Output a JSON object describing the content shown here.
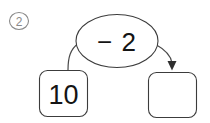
{
  "page": {
    "background_color": "#ffffff",
    "width": 210,
    "height": 123,
    "ink_color": "#2e2e2e",
    "marker_color": "#8a8a8a"
  },
  "problem_marker": {
    "label": "2",
    "glyph": "②",
    "description": "circled-number-two"
  },
  "operation_bubble": {
    "text": "− 2",
    "operator": "−",
    "operand": "2"
  },
  "input_box": {
    "value": "10"
  },
  "output_box": {
    "value": "",
    "placeholder": ""
  },
  "connectors": {
    "input_to_bubble_label": "link-from-input-box-to-operation",
    "bubble_to_output_label": "arrow-from-operation-to-output-box"
  }
}
